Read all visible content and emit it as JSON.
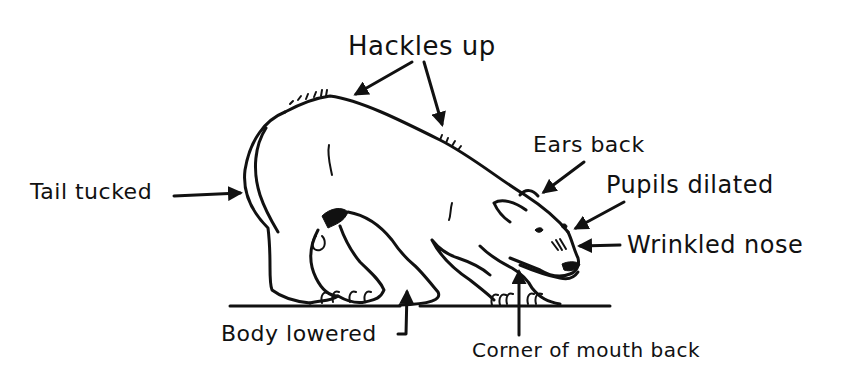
{
  "diagram": {
    "labels": {
      "hackles": "Hackles up",
      "ears": "Ears back",
      "pupils": "Pupils dilated",
      "nose": "Wrinkled nose",
      "tail": "Tail tucked",
      "body": "Body lowered",
      "mouth": "Corner of mouth back"
    },
    "colors": {
      "ink": "#111111",
      "background": "#ffffff"
    }
  }
}
